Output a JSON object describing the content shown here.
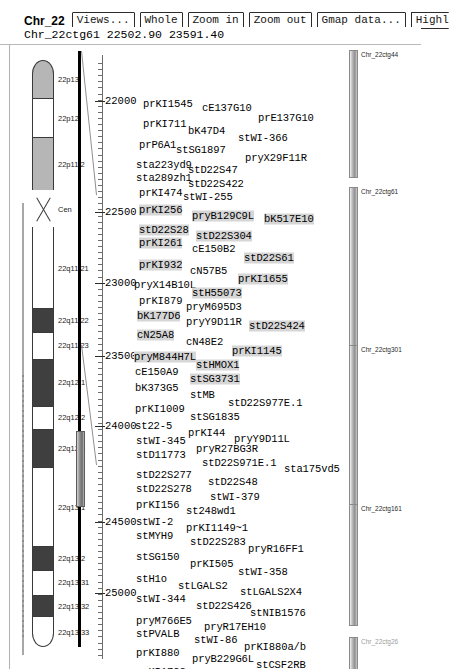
{
  "window": {
    "title": "Chr_22",
    "location_text": "Chr_22ctg61 22502.90 23591.40"
  },
  "toolbar": {
    "buttons": [
      {
        "label": "Views...",
        "name": "views-button"
      },
      {
        "label": "Whole",
        "name": "whole-button"
      },
      {
        "label": "Zoom in",
        "name": "zoom-in-button"
      },
      {
        "label": "Zoom out",
        "name": "zoom-out-button"
      },
      {
        "label": "Gmap data...",
        "name": "gmap-data-button"
      },
      {
        "label": "Highl",
        "name": "highlight-button"
      }
    ]
  },
  "ideogram": {
    "chromosome": "22",
    "bands": [
      {
        "label": "22p13",
        "stain": "gpos50",
        "top": 0,
        "height": 42
      },
      {
        "label": "22p12",
        "stain": "gneg",
        "top": 42,
        "height": 44
      },
      {
        "label": "22p11.2",
        "stain": "gpos50",
        "top": 86,
        "height": 58
      },
      {
        "label": "Cen",
        "stain": "acen",
        "top": 144,
        "height": 42
      },
      {
        "label": "22q11.21",
        "stain": "gneg",
        "top": 186,
        "height": 90
      },
      {
        "label": "22q11.22",
        "stain": "gpos100",
        "top": 276,
        "height": 26
      },
      {
        "label": "22q11.23",
        "stain": "gneg",
        "top": 302,
        "height": 30
      },
      {
        "label": "22q12.1",
        "stain": "gpos100",
        "top": 332,
        "height": 52
      },
      {
        "label": "22q12.2",
        "stain": "gneg",
        "top": 384,
        "height": 26
      },
      {
        "label": "22q12.3",
        "stain": "gpos100",
        "top": 410,
        "height": 42
      },
      {
        "label": "22q13.1",
        "stain": "gneg",
        "top": 452,
        "height": 88
      },
      {
        "label": "22q13.2",
        "stain": "gpos100",
        "top": 540,
        "height": 26
      },
      {
        "label": "22q13.31",
        "stain": "gneg",
        "top": 566,
        "height": 28
      },
      {
        "label": "22q13.32",
        "stain": "gpos100",
        "top": 594,
        "height": 24
      },
      {
        "label": "22q13.33",
        "stain": "gneg",
        "top": 618,
        "height": 34
      }
    ]
  },
  "scale": {
    "ticks": [
      {
        "value": "22000",
        "top": 47
      },
      {
        "value": "22500",
        "top": 169
      },
      {
        "value": "23000",
        "top": 291
      },
      {
        "value": "23500",
        "top": 410
      },
      {
        "value": "24000",
        "top": 381
      },
      {
        "value": "24500",
        "top": 503
      },
      {
        "value": "25000",
        "top": 551
      },
      {
        "value": "25500",
        "top": 631
      }
    ],
    "labels": [
      "22000",
      "22500",
      "23000",
      "23500",
      "24000",
      "24500",
      "25000",
      "25500"
    ]
  },
  "markers": [
    {
      "text": "prKI1545",
      "x": 143,
      "y": 59,
      "hl": false
    },
    {
      "text": "cE137G10",
      "x": 202,
      "y": 63,
      "hl": false
    },
    {
      "text": "prE137G10",
      "x": 258,
      "y": 73,
      "hl": false
    },
    {
      "text": "prKI711",
      "x": 143,
      "y": 79,
      "hl": false
    },
    {
      "text": "bK47D4",
      "x": 188,
      "y": 86,
      "hl": false
    },
    {
      "text": "stWI-366",
      "x": 238,
      "y": 93,
      "hl": false
    },
    {
      "text": "prP6A1",
      "x": 139,
      "y": 100,
      "hl": false
    },
    {
      "text": "stSG1897",
      "x": 176,
      "y": 105,
      "hl": false
    },
    {
      "text": "pryX29F11R",
      "x": 245,
      "y": 113,
      "hl": false
    },
    {
      "text": "sta223yd9",
      "x": 136,
      "y": 120,
      "hl": false
    },
    {
      "text": "stD22S47",
      "x": 188,
      "y": 125,
      "hl": false
    },
    {
      "text": "sta289zh1",
      "x": 136,
      "y": 133,
      "hl": false
    },
    {
      "text": "stD22S422",
      "x": 188,
      "y": 139,
      "hl": false
    },
    {
      "text": "prKI474",
      "x": 139,
      "y": 148,
      "hl": false
    },
    {
      "text": "stWI-255",
      "x": 183,
      "y": 152,
      "hl": false
    },
    {
      "text": "prKI256",
      "x": 139,
      "y": 165,
      "hl": true
    },
    {
      "text": "pryB129C9L",
      "x": 192,
      "y": 171,
      "hl": true
    },
    {
      "text": "bK517E10",
      "x": 264,
      "y": 174,
      "hl": true
    },
    {
      "text": "stD22S28",
      "x": 139,
      "y": 185,
      "hl": true
    },
    {
      "text": "stD22S304",
      "x": 196,
      "y": 191,
      "hl": true
    },
    {
      "text": "prKI261",
      "x": 139,
      "y": 198,
      "hl": true
    },
    {
      "text": "cE150B2",
      "x": 192,
      "y": 204,
      "hl": false
    },
    {
      "text": "stD22S61",
      "x": 244,
      "y": 213,
      "hl": true
    },
    {
      "text": "prKI932",
      "x": 139,
      "y": 220,
      "hl": true
    },
    {
      "text": "cN57B5",
      "x": 190,
      "y": 226,
      "hl": false
    },
    {
      "text": "prKI1655",
      "x": 238,
      "y": 234,
      "hl": true
    },
    {
      "text": "pryX14B10L",
      "x": 134,
      "y": 240,
      "hl": false
    },
    {
      "text": "stH55073",
      "x": 192,
      "y": 248,
      "hl": true
    },
    {
      "text": "prKI879",
      "x": 139,
      "y": 256,
      "hl": false
    },
    {
      "text": "pryM695D3",
      "x": 186,
      "y": 262,
      "hl": false
    },
    {
      "text": "bK177D6",
      "x": 137,
      "y": 271,
      "hl": true
    },
    {
      "text": "pryY9D11R",
      "x": 186,
      "y": 277,
      "hl": false
    },
    {
      "text": "stD22S424",
      "x": 249,
      "y": 281,
      "hl": true
    },
    {
      "text": "cN25A8",
      "x": 137,
      "y": 290,
      "hl": true
    },
    {
      "text": "cN48E2",
      "x": 186,
      "y": 297,
      "hl": false
    },
    {
      "text": "prKI1145",
      "x": 232,
      "y": 306,
      "hl": true
    },
    {
      "text": "pryM844H7L",
      "x": 134,
      "y": 312,
      "hl": true
    },
    {
      "text": "stHMOX1",
      "x": 196,
      "y": 320,
      "hl": true
    },
    {
      "text": "cE150A9",
      "x": 135,
      "y": 327,
      "hl": false
    },
    {
      "text": "stSG3731",
      "x": 190,
      "y": 334,
      "hl": true
    },
    {
      "text": "bK373G5",
      "x": 135,
      "y": 343,
      "hl": false
    },
    {
      "text": "stMB",
      "x": 190,
      "y": 350,
      "hl": false
    },
    {
      "text": "stD22S977E.1",
      "x": 228,
      "y": 358,
      "hl": false
    },
    {
      "text": "prKI1009",
      "x": 135,
      "y": 364,
      "hl": false
    },
    {
      "text": "stSG1835",
      "x": 190,
      "y": 372,
      "hl": false
    },
    {
      "text": "st22-5",
      "x": 135,
      "y": 381,
      "hl": false
    },
    {
      "text": "prKI44",
      "x": 188,
      "y": 388,
      "hl": false
    },
    {
      "text": "pryY9D11L",
      "x": 234,
      "y": 394,
      "hl": false
    },
    {
      "text": "stWI-345",
      "x": 136,
      "y": 396,
      "hl": false
    },
    {
      "text": "pryR27BG3R",
      "x": 196,
      "y": 404,
      "hl": false
    },
    {
      "text": "stD11773",
      "x": 136,
      "y": 410,
      "hl": false
    },
    {
      "text": "stD22S971E.1",
      "x": 202,
      "y": 418,
      "hl": false
    },
    {
      "text": "sta175vd5",
      "x": 284,
      "y": 424,
      "hl": false
    },
    {
      "text": "stD22S277",
      "x": 136,
      "y": 430,
      "hl": false
    },
    {
      "text": "stD22S48",
      "x": 208,
      "y": 437,
      "hl": false
    },
    {
      "text": "stD22S278",
      "x": 136,
      "y": 444,
      "hl": false
    },
    {
      "text": "stWI-379",
      "x": 210,
      "y": 452,
      "hl": false
    },
    {
      "text": "prKI156",
      "x": 136,
      "y": 460,
      "hl": false
    },
    {
      "text": "st248wd1",
      "x": 186,
      "y": 466,
      "hl": false
    },
    {
      "text": "stWI-2",
      "x": 136,
      "y": 477,
      "hl": false
    },
    {
      "text": "prKI1149~1",
      "x": 186,
      "y": 483,
      "hl": false
    },
    {
      "text": "stMYH9",
      "x": 136,
      "y": 491,
      "hl": false
    },
    {
      "text": "stD22S283",
      "x": 190,
      "y": 497,
      "hl": false
    },
    {
      "text": "pryR16FF1",
      "x": 248,
      "y": 504,
      "hl": false
    },
    {
      "text": "stSG150",
      "x": 136,
      "y": 512,
      "hl": false
    },
    {
      "text": "prKI505",
      "x": 190,
      "y": 519,
      "hl": false
    },
    {
      "text": "stWI-358",
      "x": 238,
      "y": 527,
      "hl": false
    },
    {
      "text": "stH1o",
      "x": 136,
      "y": 534,
      "hl": false
    },
    {
      "text": "stLGALS2",
      "x": 178,
      "y": 541,
      "hl": false
    },
    {
      "text": "stLGALS2X4",
      "x": 240,
      "y": 547,
      "hl": false
    },
    {
      "text": "stWI-344",
      "x": 136,
      "y": 554,
      "hl": false
    },
    {
      "text": "stD22S426",
      "x": 196,
      "y": 561,
      "hl": false
    },
    {
      "text": "stNIB1576",
      "x": 250,
      "y": 568,
      "hl": false
    },
    {
      "text": "pryM766E5",
      "x": 136,
      "y": 576,
      "hl": false
    },
    {
      "text": "pryR17EH10",
      "x": 204,
      "y": 582,
      "hl": false
    },
    {
      "text": "stPVALB",
      "x": 136,
      "y": 589,
      "hl": false
    },
    {
      "text": "stWI-86",
      "x": 194,
      "y": 595,
      "hl": false
    },
    {
      "text": "prKI880a/b",
      "x": 244,
      "y": 602,
      "hl": false
    },
    {
      "text": "prKI880",
      "x": 136,
      "y": 608,
      "hl": false
    },
    {
      "text": "pryB229G6L",
      "x": 192,
      "y": 614,
      "hl": false
    },
    {
      "text": "stCSF2RB",
      "x": 256,
      "y": 620,
      "hl": false
    },
    {
      "text": "prKI1782",
      "x": 136,
      "y": 627,
      "hl": false
    },
    {
      "text": "prKI436",
      "x": 198,
      "y": 634,
      "hl": false
    },
    {
      "text": "stD22S102",
      "x": 248,
      "y": 641,
      "hl": false
    },
    {
      "text": "bK256C5",
      "x": 136,
      "y": 648,
      "hl": false
    }
  ],
  "contigs": [
    {
      "label": "Chr_22ctg44",
      "bar_top": 5,
      "bar_height": 128,
      "faded": false
    },
    {
      "label": "Chr_22ctg61",
      "bar_top": 142,
      "bar_height": 344,
      "faded": false
    },
    {
      "label": "Chr_22ctg301",
      "bar_top": 300,
      "bar_height": 183,
      "faded": false
    },
    {
      "label": "Chr_22ctg161",
      "bar_top": 459,
      "bar_height": 122,
      "faded": false
    },
    {
      "label": "Chr_22ctg26",
      "bar_top": 592,
      "bar_height": 62,
      "faded": true
    }
  ],
  "colors": {
    "gneg": "#ffffff",
    "gpos50": "#b6b6b6",
    "gpos100": "#3f3f3f",
    "acen": "#ffffff",
    "outline": "#3a3a3a",
    "highlight": "#d6d6d6"
  }
}
